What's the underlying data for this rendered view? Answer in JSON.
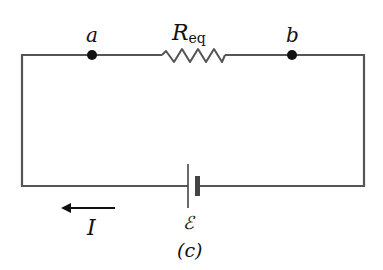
{
  "diagram": {
    "type": "circuit",
    "caption": "(c)",
    "nodes": [
      {
        "id": "a",
        "label": "a"
      },
      {
        "id": "b",
        "label": "b"
      }
    ],
    "resistor": {
      "label_main": "R",
      "label_sub": "eq"
    },
    "battery": {
      "label": "ℰ"
    },
    "current": {
      "label": "I",
      "direction": "left"
    },
    "colors": {
      "wire": "#555555",
      "node": "#111111",
      "text": "#111111"
    }
  }
}
